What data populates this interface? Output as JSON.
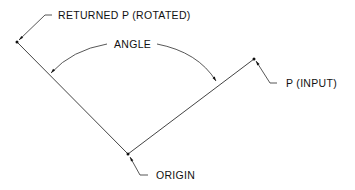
{
  "labels": {
    "returned_p": "RETURNED P (ROTATED)",
    "angle": "ANGLE",
    "p_input": "P (INPUT)",
    "origin": "ORIGIN"
  },
  "colors": {
    "line": "#333333",
    "text": "#111111",
    "background": "#ffffff"
  }
}
